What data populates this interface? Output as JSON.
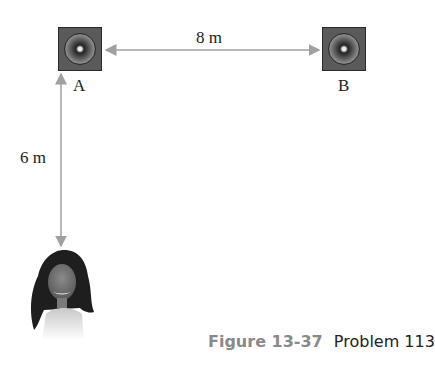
{
  "figure": {
    "speakers": [
      {
        "id": "A",
        "label": "A"
      },
      {
        "id": "B",
        "label": "B"
      }
    ],
    "dimensions": {
      "horizontal": "8 m",
      "vertical": "6 m"
    },
    "caption": {
      "figure_number": "Figure 13-37",
      "problem": "Problem 113"
    },
    "colors": {
      "arrow": "#a0a0a0",
      "caption_figure": "#8a8a8a",
      "speaker_box": "#5a5a5a"
    }
  }
}
